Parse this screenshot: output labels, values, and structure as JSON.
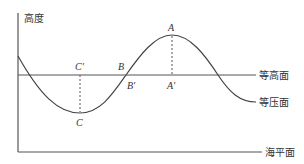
{
  "diagram": {
    "axis_label": "高度",
    "lines": {
      "isohypse": "等高面",
      "isobar": "等压面",
      "sea_level": "海平面"
    },
    "points": {
      "A": "A",
      "A_prime": "A'",
      "B": "B",
      "B_prime": "B'",
      "C": "C",
      "C_prime": "C'"
    },
    "colors": {
      "line": "#444444",
      "text": "#333333",
      "background": "#ffffff"
    }
  }
}
